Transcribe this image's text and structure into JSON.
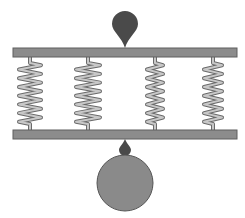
{
  "diagram": {
    "title": "",
    "colors": {
      "background": "#ffffff",
      "plate_fill": "#8c8c8c",
      "plate_stroke": "#5f5f5f",
      "spring_fill": "#c8c8c8",
      "spring_stroke": "#6a6a6a",
      "drop_fill": "#4a4a4a",
      "ball_fill": "#8a8a8a",
      "ball_stroke": "#555555"
    },
    "top_plate": {
      "x": 13,
      "y": 48,
      "width": 224,
      "height": 9
    },
    "bottom_plate": {
      "x": 13,
      "y": 130,
      "width": 224,
      "height": 9
    },
    "top_drop": {
      "cx": 125,
      "cy": 24,
      "r": 13,
      "tip_y": 48
    },
    "bottom_drop": {
      "cx": 125,
      "cy": 150,
      "r": 6,
      "top_y": 139
    },
    "ball": {
      "cx": 125,
      "cy": 183,
      "r": 28
    },
    "springs": [
      {
        "id": "spring-1",
        "x": 30,
        "coils": 7,
        "width": 22
      },
      {
        "id": "spring-2",
        "x": 88,
        "coils": 7,
        "width": 24
      },
      {
        "id": "spring-3",
        "x": 155,
        "coils": 7,
        "width": 16
      },
      {
        "id": "spring-4",
        "x": 213,
        "coils": 7,
        "width": 18
      }
    ]
  }
}
